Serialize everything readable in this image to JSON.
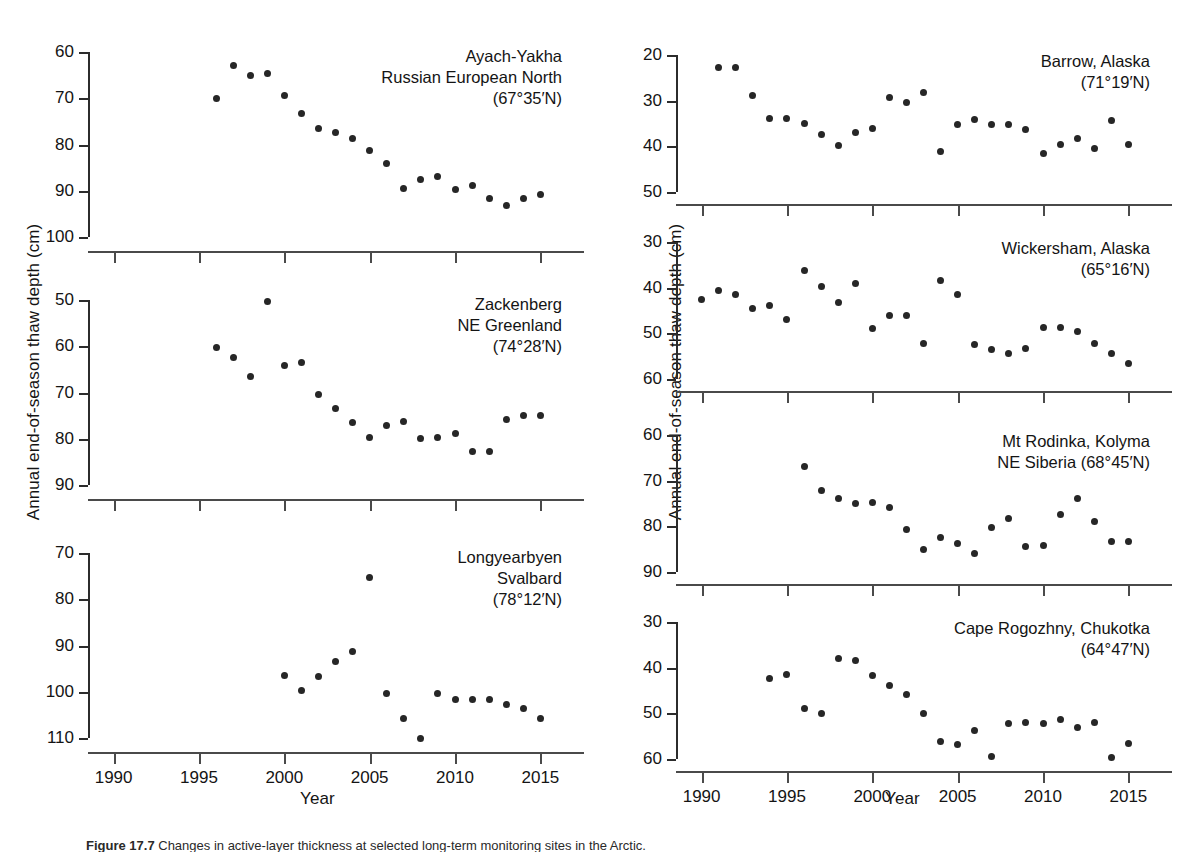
{
  "figure": {
    "ylabel_left": "Annual end-of-season thaw depth (cm)",
    "ylabel_right": "Annual end-of-season thaw depth (cm)",
    "xlabel_left": "Year",
    "xlabel_right": "Year",
    "caption_prefix": "Figure 17.7",
    "caption_text": "Changes in active-layer thickness at selected long-term monitoring sites in the Arctic."
  },
  "chart_data": [
    {
      "id": "ayach-yakha",
      "type": "scatter",
      "title": "Ayach-Yakha\nRussian European North\n(67°35′N)",
      "title_lines": [
        "Ayach-Yakha",
        "Russian European North",
        "(67°35′N)"
      ],
      "xlabel": "Year",
      "ylabel": "Annual end-of-season thaw depth (cm)",
      "xlim": [
        1988.5,
        2016.5
      ],
      "ylim": [
        100,
        60
      ],
      "y_inverted": true,
      "yticks": [
        60,
        70,
        80,
        90,
        100
      ],
      "xticks": [
        1990,
        1995,
        2000,
        2005,
        2010,
        2015
      ],
      "grid": false,
      "x": [
        1996,
        1997,
        1998,
        1999,
        2000,
        2001,
        2002,
        2003,
        2004,
        2005,
        2006,
        2007,
        2008,
        2009,
        2010,
        2011,
        2012,
        2013,
        2014,
        2015
      ],
      "values": [
        70.0,
        62.9,
        65.1,
        64.6,
        69.5,
        73.4,
        76.5,
        77.5,
        78.8,
        81.3,
        84.2,
        89.5,
        87.5,
        86.9,
        89.7,
        88.8,
        91.6,
        93.2,
        91.6,
        90.8
      ]
    },
    {
      "id": "zackenberg",
      "type": "scatter",
      "title": "Zackenberg\nNE Greenland\n(74°28′N)",
      "title_lines": [
        "Zackenberg",
        "NE Greenland",
        "(74°28′N)"
      ],
      "xlabel": "Year",
      "ylabel": "Annual end-of-season thaw depth (cm)",
      "xlim": [
        1988.5,
        2016.5
      ],
      "ylim": [
        90,
        50
      ],
      "y_inverted": true,
      "yticks": [
        50,
        60,
        70,
        80,
        90
      ],
      "xticks": [
        1990,
        1995,
        2000,
        2005,
        2010,
        2015
      ],
      "grid": false,
      "x": [
        1996,
        1997,
        1998,
        1999,
        2000,
        2001,
        2002,
        2003,
        2004,
        2005,
        2006,
        2007,
        2008,
        2009,
        2010,
        2011,
        2012,
        2013,
        2014,
        2015
      ],
      "values": [
        60.2,
        62.5,
        66.5,
        50.3,
        64.1,
        63.5,
        70.4,
        73.5,
        76.5,
        79.7,
        77.1,
        76.2,
        80.0,
        79.8,
        78.9,
        82.7,
        82.7,
        75.8,
        75.0,
        75.0
      ]
    },
    {
      "id": "longyearbyen",
      "type": "scatter",
      "title": "Longyearbyen\nSvalbard\n(78°12′N)",
      "title_lines": [
        "Longyearbyen",
        "Svalbard",
        "(78°12′N)"
      ],
      "xlabel": "Year",
      "ylabel": "Annual end-of-season thaw depth (cm)",
      "xlim": [
        1988.5,
        2016.5
      ],
      "ylim": [
        110,
        70
      ],
      "y_inverted": true,
      "yticks": [
        70,
        80,
        90,
        100,
        110
      ],
      "xticks": [
        1990,
        1995,
        2000,
        2005,
        2010,
        2015
      ],
      "grid": false,
      "x": [
        2000,
        2001,
        2002,
        2003,
        2004,
        2005,
        2006,
        2007,
        2008,
        2009,
        2010,
        2011,
        2012,
        2013,
        2014,
        2015
      ],
      "values": [
        96.5,
        99.8,
        96.7,
        93.5,
        91.4,
        75.3,
        100.3,
        105.7,
        110.0,
        100.3,
        101.7,
        101.6,
        101.6,
        102.7,
        103.7,
        105.8
      ]
    },
    {
      "id": "barrow",
      "type": "scatter",
      "title": "Barrow, Alaska\n(71°19′N)",
      "title_lines": [
        "Barrow, Alaska",
        "(71°19′N)"
      ],
      "xlabel": "Year",
      "ylabel": "Annual end-of-season thaw depth (cm)",
      "xlim": [
        1988.5,
        2016.5
      ],
      "ylim": [
        50,
        20
      ],
      "y_inverted": true,
      "yticks": [
        20,
        30,
        40,
        50
      ],
      "xticks": [
        1990,
        1995,
        2000,
        2005,
        2010,
        2015
      ],
      "grid": false,
      "x": [
        1991,
        1992,
        1993,
        1994,
        1995,
        1996,
        1997,
        1998,
        1999,
        2000,
        2001,
        2002,
        2003,
        2004,
        2005,
        2006,
        2007,
        2008,
        2009,
        2010,
        2011,
        2012,
        2013,
        2014,
        2015
      ],
      "values": [
        22.8,
        22.8,
        28.8,
        33.8,
        33.8,
        35.1,
        37.3,
        39.9,
        37.0,
        36.2,
        29.2,
        30.3,
        28.3,
        41.1,
        35.2,
        34.1,
        35.2,
        35.2,
        36.3,
        41.6,
        39.5,
        38.3,
        40.4,
        34.3,
        39.5
      ]
    },
    {
      "id": "wickersham",
      "type": "scatter",
      "title": "Wickersham, Alaska\n(65°16′N)",
      "title_lines": [
        "Wickersham, Alaska",
        "(65°16′N)"
      ],
      "xlabel": "Year",
      "ylabel": "Annual end-of-season thaw depth (cm)",
      "xlim": [
        1988.5,
        2016.5
      ],
      "ylim": [
        60,
        30
      ],
      "y_inverted": true,
      "yticks": [
        30,
        40,
        50,
        60
      ],
      "xticks": [
        1990,
        1995,
        2000,
        2005,
        2010,
        2015
      ],
      "grid": false,
      "x": [
        1990,
        1991,
        1992,
        1993,
        1994,
        1995,
        1996,
        1997,
        1998,
        1999,
        2000,
        2001,
        2002,
        2003,
        2004,
        2005,
        2006,
        2007,
        2008,
        2009,
        2010,
        2011,
        2012,
        2013,
        2014,
        2015
      ],
      "values": [
        42.6,
        40.7,
        41.6,
        44.6,
        44.0,
        47.0,
        36.2,
        39.8,
        43.2,
        39.0,
        49.0,
        46.0,
        46.0,
        52.2,
        38.4,
        41.4,
        52.5,
        53.5,
        54.4,
        53.4,
        48.7,
        48.8,
        49.5,
        52.2,
        54.4,
        56.7
      ]
    },
    {
      "id": "mt-rodinka",
      "type": "scatter",
      "title": "Mt Rodinka, Kolyma\nNE Siberia (68°45′N)",
      "title_lines": [
        "Mt Rodinka, Kolyma",
        "NE Siberia (68°45′N)"
      ],
      "xlabel": "Year",
      "ylabel": "Annual end-of-season thaw depth (cm)",
      "xlim": [
        1988.5,
        2016.5
      ],
      "ylim": [
        90,
        60
      ],
      "y_inverted": true,
      "yticks": [
        60,
        70,
        80,
        90
      ],
      "xticks": [
        1990,
        1995,
        2000,
        2005,
        2010,
        2015
      ],
      "grid": false,
      "x": [
        1996,
        1997,
        1998,
        1999,
        2000,
        2001,
        2002,
        2003,
        2004,
        2005,
        2006,
        2007,
        2008,
        2009,
        2010,
        2011,
        2012,
        2013,
        2014,
        2015
      ],
      "values": [
        66.8,
        72.1,
        74.0,
        75.0,
        74.8,
        75.8,
        80.8,
        85.1,
        82.4,
        83.7,
        86.0,
        80.2,
        78.2,
        84.4,
        84.3,
        77.5,
        73.9,
        79.0,
        83.4,
        83.4
      ]
    },
    {
      "id": "cape-rogozhny",
      "type": "scatter",
      "title": "Cape Rogozhny, Chukotka\n(64°47′N)",
      "title_lines": [
        "Cape Rogozhny, Chukotka",
        "(64°47′N)"
      ],
      "xlabel": "Year",
      "ylabel": "Annual end-of-season thaw depth (cm)",
      "xlim": [
        1988.5,
        2016.5
      ],
      "ylim": [
        60,
        30
      ],
      "y_inverted": true,
      "yticks": [
        30,
        40,
        50,
        60
      ],
      "xticks": [
        1990,
        1995,
        2000,
        2005,
        2010,
        2015
      ],
      "grid": false,
      "x": [
        1994,
        1995,
        1996,
        1997,
        1998,
        1999,
        2000,
        2001,
        2002,
        2003,
        2004,
        2005,
        2006,
        2007,
        2008,
        2009,
        2010,
        2011,
        2012,
        2013,
        2014,
        2015
      ],
      "values": [
        42.4,
        41.5,
        48.9,
        50.0,
        37.9,
        38.5,
        41.8,
        43.8,
        45.8,
        50.0,
        56.2,
        56.8,
        53.7,
        59.5,
        52.2,
        52.1,
        52.2,
        51.4,
        53.2,
        52.1,
        59.6,
        56.6
      ]
    }
  ],
  "panel_layout": [
    {
      "id": "ayach-yakha",
      "column": "left",
      "left": 88,
      "top": 52,
      "width": 478,
      "height": 185,
      "axis_gap": 14,
      "title_right": 4,
      "title_top": -6
    },
    {
      "id": "zackenberg",
      "column": "left",
      "left": 88,
      "top": 300,
      "width": 478,
      "height": 185,
      "axis_gap": 14,
      "title_right": 4,
      "title_top": -6
    },
    {
      "id": "longyearbyen",
      "column": "left",
      "left": 88,
      "top": 553,
      "width": 478,
      "height": 185,
      "axis_gap": 14,
      "title_right": 4,
      "title_top": -6
    },
    {
      "id": "barrow",
      "column": "right",
      "left": 676,
      "top": 55,
      "width": 478,
      "height": 137,
      "axis_gap": 12,
      "title_right": 4,
      "title_top": -4
    },
    {
      "id": "wickersham",
      "column": "right",
      "left": 676,
      "top": 242,
      "width": 478,
      "height": 137,
      "axis_gap": 12,
      "title_right": 4,
      "title_top": -4
    },
    {
      "id": "mt-rodinka",
      "column": "right",
      "left": 676,
      "top": 435,
      "width": 478,
      "height": 137,
      "axis_gap": 12,
      "title_right": 4,
      "title_top": -4
    },
    {
      "id": "cape-rogozhny",
      "column": "right",
      "left": 676,
      "top": 622,
      "width": 478,
      "height": 137,
      "axis_gap": 12,
      "title_right": 4,
      "title_top": -4
    }
  ],
  "xaxis_shared": {
    "left_column": {
      "labels_visible": true,
      "label_y": 764
    },
    "right_column": {
      "labels_visible": true,
      "label_y": 764
    }
  }
}
